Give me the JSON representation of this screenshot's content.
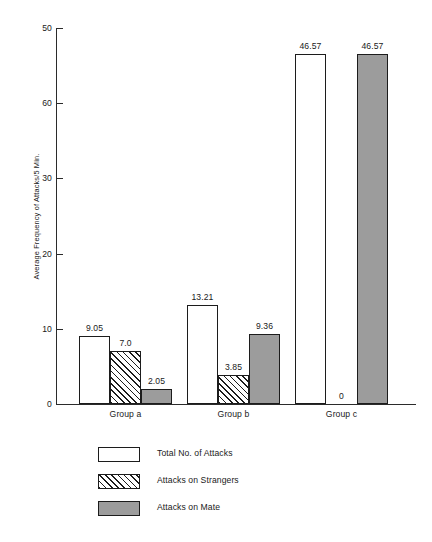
{
  "chart_data": {
    "type": "bar",
    "title": "",
    "xlabel": "",
    "ylabel": "Average Frequency of Attacks/5 Min.",
    "categories": [
      "Group a",
      "Group b",
      "Group c"
    ],
    "series": [
      {
        "name": "Total No. of Attacks",
        "fill": "white",
        "values": [
          9.05,
          13.21,
          46.57
        ],
        "labels": [
          "9.05",
          "13.21",
          "46.57"
        ]
      },
      {
        "name": "Attacks on Strangers",
        "fill": "hatch",
        "values": [
          7.0,
          3.85,
          0
        ],
        "labels": [
          "7.0",
          "3.85",
          "0"
        ]
      },
      {
        "name": "Attacks on Mate",
        "fill": "gray",
        "values": [
          2.05,
          9.36,
          46.57
        ],
        "labels": [
          "2.05",
          "9.36",
          "46.57"
        ]
      }
    ],
    "ytick_labels": [
      "50",
      "60",
      "30",
      "20",
      "10",
      "0"
    ],
    "ytick_values": [
      50,
      40,
      30,
      20,
      10,
      0
    ],
    "ylim": [
      0,
      54.5
    ],
    "grid": false,
    "legend_position": "bottom-left",
    "colors": {
      "fill_white": "#ffffff",
      "fill_gray": "#9c9c9c",
      "hatch_line": "#1c1c1c",
      "axis": "#2b2b2b",
      "text": "#1a1a1a",
      "background": "#ffffff"
    }
  },
  "legend": {
    "entries": [
      {
        "label": "Total No. of Attacks"
      },
      {
        "label": "Attacks on Strangers"
      },
      {
        "label": "Attacks on Mate"
      }
    ]
  }
}
